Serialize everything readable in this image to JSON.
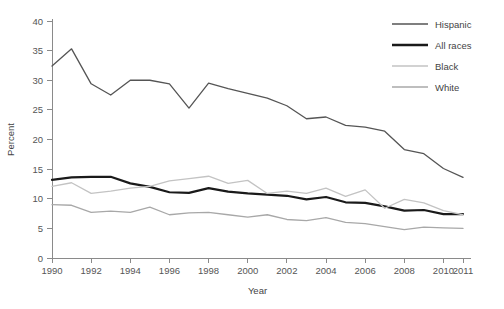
{
  "chart_data": {
    "type": "line",
    "title": "",
    "xlabel": "Year",
    "ylabel": "Percent",
    "xlim": [
      1990,
      2011
    ],
    "ylim": [
      0,
      40
    ],
    "grid": false,
    "legend_position": "top-right",
    "x": [
      1990,
      1991,
      1992,
      1993,
      1994,
      1995,
      1996,
      1997,
      1998,
      1999,
      2000,
      2001,
      2002,
      2003,
      2004,
      2005,
      2006,
      2007,
      2008,
      2009,
      2010,
      2011
    ],
    "xticks": [
      1990,
      1992,
      1994,
      1996,
      1998,
      2000,
      2002,
      2004,
      2006,
      2008,
      2010,
      2011
    ],
    "xticklabels": [
      "1990",
      "1992",
      "1994",
      "1996",
      "1998",
      "2000",
      "2002",
      "2004",
      "2006",
      "2008",
      "2010",
      "2011"
    ],
    "yticks": [
      0,
      5,
      10,
      15,
      20,
      25,
      30,
      35,
      40
    ],
    "yticklabels": [
      "0",
      "5",
      "10",
      "15",
      "20",
      "25",
      "30",
      "35",
      "40"
    ],
    "series": [
      {
        "name": "Hispanic",
        "color": "#555555",
        "width": 1.3,
        "values": [
          32.4,
          35.3,
          29.4,
          27.5,
          30.0,
          30.0,
          29.4,
          25.3,
          29.5,
          28.6,
          27.8,
          27.0,
          25.7,
          23.5,
          23.8,
          22.4,
          22.1,
          21.4,
          18.3,
          17.6,
          15.1,
          13.6
        ]
      },
      {
        "name": "All races",
        "color": "#1a1a1a",
        "width": 2.2,
        "values": [
          13.2,
          13.6,
          13.7,
          13.7,
          12.6,
          12.0,
          11.1,
          11.0,
          11.8,
          11.2,
          10.9,
          10.7,
          10.5,
          9.9,
          10.3,
          9.4,
          9.3,
          8.7,
          8.0,
          8.1,
          7.4,
          7.4
        ]
      },
      {
        "name": "Black",
        "color": "#c3c3c3",
        "width": 1.3,
        "values": [
          12.1,
          12.7,
          10.9,
          11.3,
          11.8,
          12.1,
          13.0,
          13.4,
          13.8,
          12.6,
          13.1,
          10.9,
          11.3,
          10.9,
          11.8,
          10.4,
          11.5,
          8.4,
          9.9,
          9.3,
          8.0,
          7.3
        ]
      },
      {
        "name": "White",
        "color": "#a8a8a8",
        "width": 1.3,
        "values": [
          9.0,
          8.9,
          7.7,
          7.9,
          7.7,
          8.6,
          7.3,
          7.6,
          7.7,
          7.3,
          6.9,
          7.3,
          6.5,
          6.3,
          6.8,
          6.0,
          5.8,
          5.3,
          4.8,
          5.2,
          5.1,
          5.0
        ]
      }
    ]
  },
  "legend": {
    "items": [
      {
        "label": "Hispanic"
      },
      {
        "label": "All races"
      },
      {
        "label": "Black"
      },
      {
        "label": "White"
      }
    ]
  },
  "axes": {
    "x_title": "Year",
    "y_title": "Percent"
  }
}
